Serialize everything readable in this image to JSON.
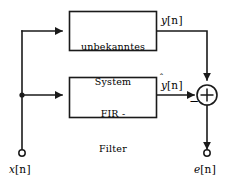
{
  "diagram": {
    "stroke_color": "#1a1a1a",
    "fill_color": "#ffffff",
    "blocks": [
      {
        "id": "unknown-system",
        "line1": "unbekanntes",
        "line2": "System",
        "x": 69,
        "y": 11,
        "w": 88,
        "h": 40
      },
      {
        "id": "fir-filter",
        "line1": "FIR -",
        "line2": "Filter",
        "x": 69,
        "y": 77,
        "w": 88,
        "h": 41
      }
    ],
    "signals": {
      "input": "x",
      "input_index": "[n]",
      "output_unknown": "y",
      "output_unknown_index": "[n]",
      "output_estimate": "y",
      "output_estimate_index": "[n]",
      "output_estimate_hat": "̂",
      "error": "e",
      "error_index": "[n]"
    },
    "adder": {
      "id": "summing-junction",
      "symbol": "+",
      "negative_sign": "−",
      "cx": 207,
      "cy": 95,
      "r": 10
    },
    "terminals": [
      {
        "id": "input-terminal",
        "cx": 22,
        "cy": 153,
        "r": 3.2
      },
      {
        "id": "output-terminal",
        "cx": 207,
        "cy": 153,
        "r": 3.2
      }
    ],
    "junction": {
      "id": "branch-node",
      "cx": 22,
      "cy": 95,
      "r": 2.6
    }
  }
}
